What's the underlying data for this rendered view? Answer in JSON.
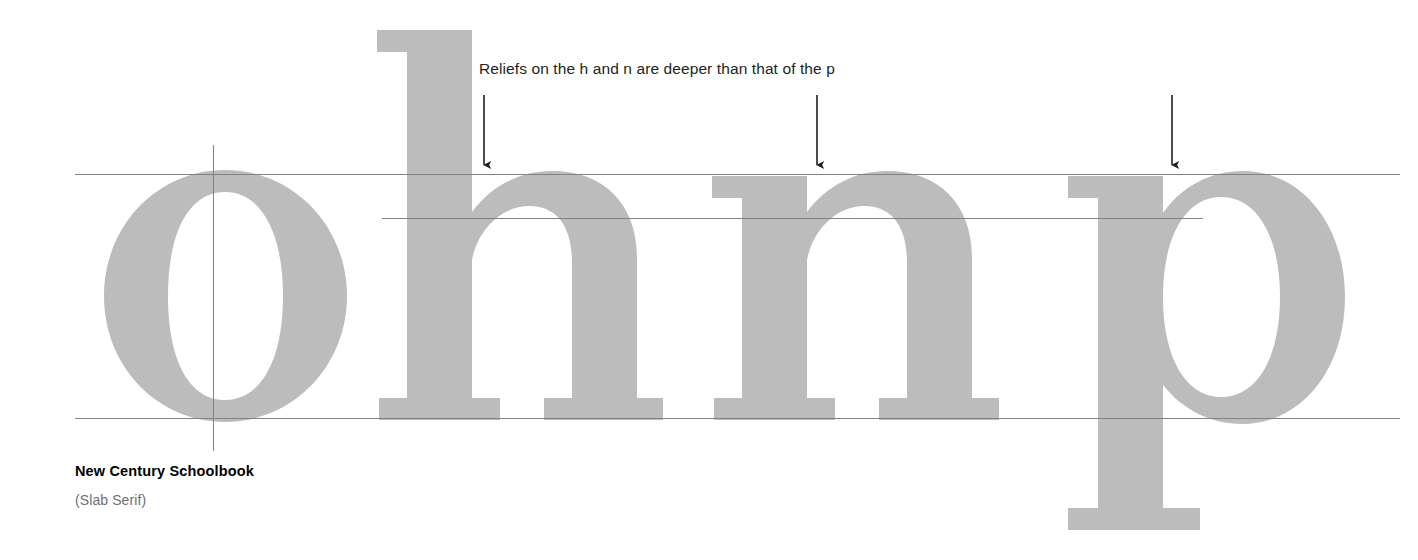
{
  "figure": {
    "kind": "typography-specimen-diagram",
    "background_color": "#ffffff",
    "annotation": {
      "text": "Reliefs on the h and n are deeper than that of the p",
      "color": "#231f20"
    },
    "caption": {
      "typeface_name": "New Century Schoolbook",
      "classification": "(Slab Serif)",
      "title_color": "#000000",
      "sub_color": "#6d6e71"
    },
    "specimen": {
      "letters": "ohnp",
      "glyph_fill": "#bcbcbc",
      "glyphs": [
        {
          "char": "o",
          "name": "glyph-o"
        },
        {
          "char": "h",
          "name": "glyph-h"
        },
        {
          "char": "n",
          "name": "glyph-n"
        },
        {
          "char": "p",
          "name": "glyph-p"
        }
      ]
    },
    "guides": {
      "line_color": "#808285",
      "x_height_line_label": "x-height",
      "baseline_label": "baseline",
      "overshoot_line_label": "relief-depth-line",
      "vertical_axis_label": "stress-axis"
    },
    "arrows": {
      "count": 3,
      "color": "#231f20",
      "targets": [
        "h",
        "n",
        "p"
      ]
    }
  }
}
